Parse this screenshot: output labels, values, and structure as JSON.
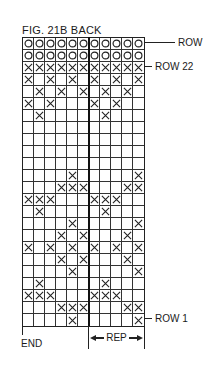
{
  "figure": {
    "title": "FIG. 21B  BACK",
    "row_labels": [
      {
        "text": "ROW",
        "row": 24
      },
      {
        "text": "ROW 22",
        "row": 22
      },
      {
        "text": "ROW 1",
        "row": 1
      }
    ],
    "end_label": "END",
    "rep_label": "REP"
  },
  "chart_data": {
    "type": "diagram",
    "title": "FIG. 21B BACK",
    "columns": 11,
    "rows_count": 24,
    "repeat": {
      "label": "REP",
      "from_col": 7,
      "to_col": 11
    },
    "end": {
      "label": "END",
      "col": 1
    },
    "rows": [
      {
        "row": 24,
        "cells": "OOOOOOOOOOO"
      },
      {
        "row": 23,
        "cells": "OOOOOOOOOOO"
      },
      {
        "row": 22,
        "cells": "XXXXXXXXXXX"
      },
      {
        "row": 21,
        "cells": "X.X.X.X.X.X"
      },
      {
        "row": 20,
        "cells": ".X.X.X.X.X."
      },
      {
        "row": 19,
        "cells": "X.X...X.X.."
      },
      {
        "row": 18,
        "cells": ".X.....X..."
      },
      {
        "row": 17,
        "cells": "..........."
      },
      {
        "row": 16,
        "cells": "..........."
      },
      {
        "row": 15,
        "cells": "..........."
      },
      {
        "row": 14,
        "cells": "..........."
      },
      {
        "row": 13,
        "cells": "....X.....X"
      },
      {
        "row": 12,
        "cells": "...XXX...XX"
      },
      {
        "row": 11,
        "cells": "XXX...XXX.."
      },
      {
        "row": 10,
        "cells": ".X.....X..."
      },
      {
        "row": 9,
        "cells": "....X.....X"
      },
      {
        "row": 8,
        "cells": "...X.X...X."
      },
      {
        "row": 7,
        "cells": "X.X.X.X.X.X"
      },
      {
        "row": 6,
        "cells": "...X.X...X."
      },
      {
        "row": 5,
        "cells": "....X.....X"
      },
      {
        "row": 4,
        "cells": ".X.....X..."
      },
      {
        "row": 3,
        "cells": "XXX...XXX.."
      },
      {
        "row": 2,
        "cells": "...XXX...XX"
      },
      {
        "row": 1,
        "cells": "....X.....X"
      }
    ]
  }
}
